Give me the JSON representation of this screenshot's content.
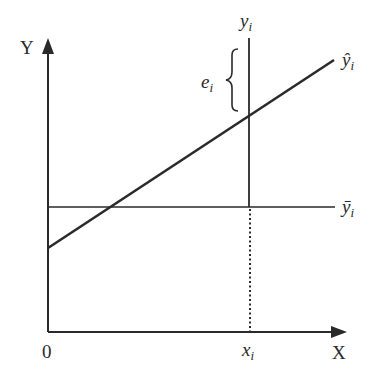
{
  "diagram": {
    "axes": {
      "y_label": "Y",
      "x_label": "X",
      "origin_label": "0"
    },
    "points": {
      "x_i_label": "x",
      "x_i_sub": "i",
      "y_i_label": "y",
      "y_i_sub": "i"
    },
    "lines": {
      "regression_label": "ŷ",
      "regression_sub": "i",
      "mean_label": "ȳ",
      "mean_sub": "i"
    },
    "residual": {
      "label": "e",
      "sub": "i"
    },
    "colors": {
      "stroke": "#2a2a2a",
      "background": "#ffffff"
    }
  }
}
